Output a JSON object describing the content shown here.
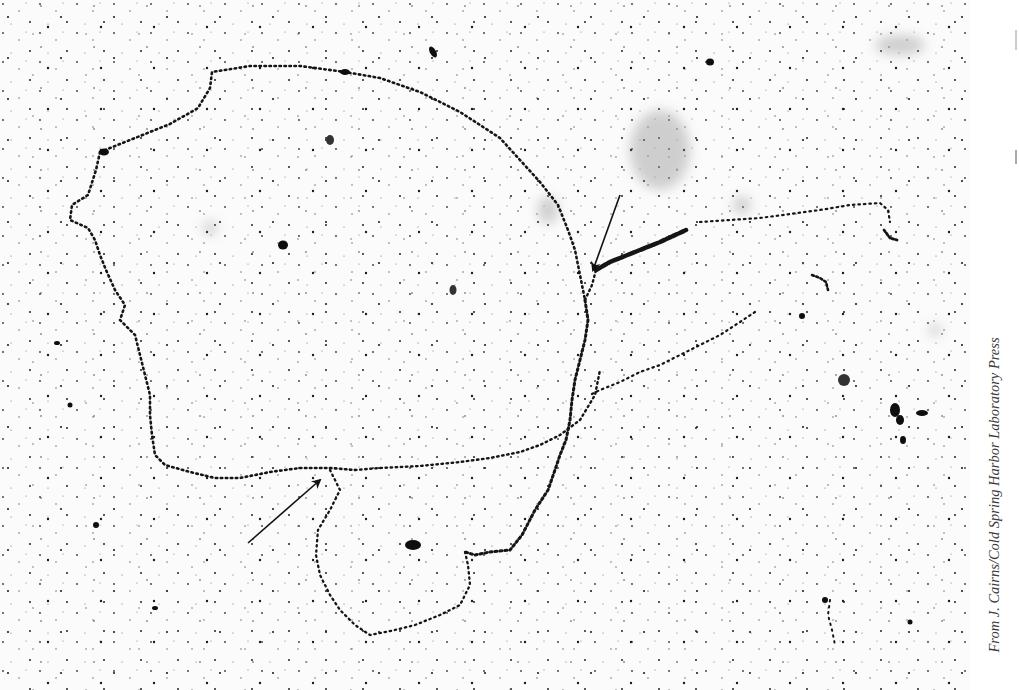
{
  "figure": {
    "background_color": "#fbfbfb",
    "grain_color": "#111111",
    "annotations": [
      {
        "id": "arrow-lower",
        "description": "Arrow pointing up-right to replication fork on lower left loop",
        "tail": [
          248,
          543
        ],
        "head": [
          322,
          478
        ]
      },
      {
        "id": "arrow-upper",
        "description": "Arrow pointing down-left to replication fork near branch point",
        "tail": [
          620,
          195
        ],
        "head": [
          592,
          272
        ]
      }
    ]
  },
  "credit": {
    "text": "From J. Cairns/Cold Spring Harbor Laboratory Press"
  }
}
